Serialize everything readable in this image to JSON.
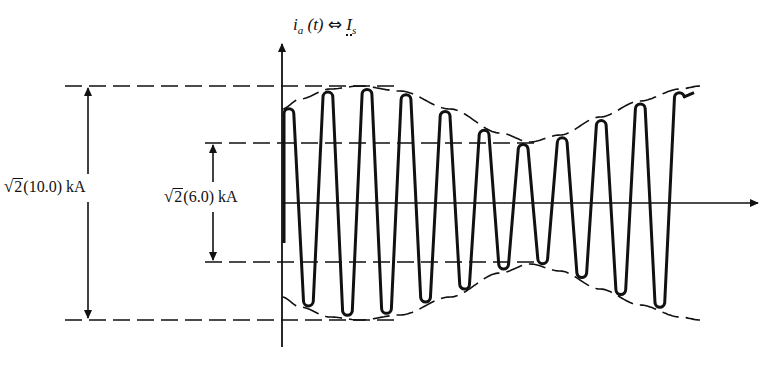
{
  "figure": {
    "y_axis_label": {
      "symbol": "i",
      "subscript": "a",
      "arg": "(t)",
      "relation": "⇔",
      "phasor": "I",
      "phasor_subscript": "s"
    },
    "outer_dimension": {
      "sqrt_arg": "2",
      "value": "(10.0)",
      "unit": "kA"
    },
    "inner_dimension": {
      "sqrt_arg": "2",
      "value": "(6.0)",
      "unit": "kA"
    }
  },
  "chart_data": {
    "type": "line",
    "title": "",
    "xlabel": "t",
    "ylabel": "i_a(t) ⇔ I_s",
    "annotations": [
      {
        "label": "√2(10.0) kA",
        "meaning": "envelope maximum amplitude",
        "value_kA_peak": 14.14
      },
      {
        "label": "√2(6.0) kA",
        "meaning": "envelope minimum amplitude",
        "value_kA_peak": 8.49
      }
    ],
    "envelope": {
      "max_rms_kA": 10.0,
      "min_rms_kA": 6.0,
      "shape": "starts ~8.6, rises to max 10.0, falls to min 6.0, rises back toward 10.0"
    },
    "cycles_visible": 10.5,
    "grid": false,
    "legend": null
  }
}
